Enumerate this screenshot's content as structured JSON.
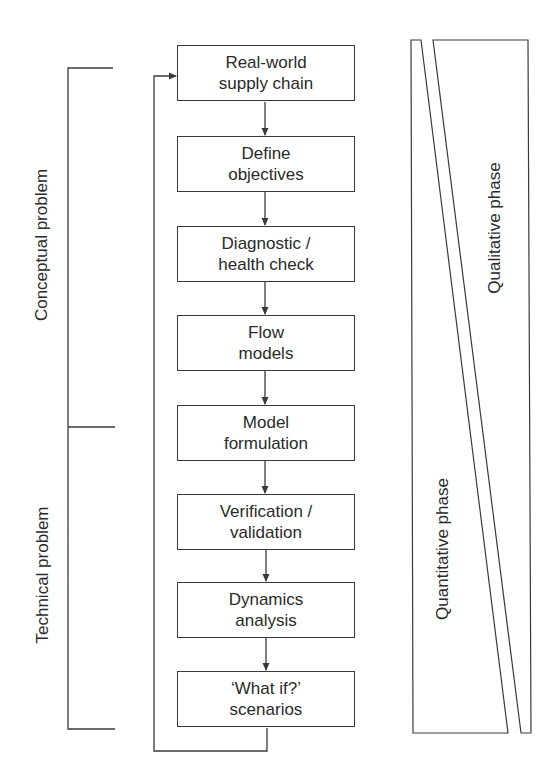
{
  "diagram": {
    "type": "process-flowchart",
    "steps": [
      {
        "line1": "Real-world",
        "line2": "supply chain"
      },
      {
        "line1": "Define",
        "line2": "objectives"
      },
      {
        "line1": "Diagnostic /",
        "line2": "health check"
      },
      {
        "line1": "Flow",
        "line2": "models"
      },
      {
        "line1": "Model",
        "line2": "formulation"
      },
      {
        "line1": "Verification /",
        "line2": "validation"
      },
      {
        "line1": "Dynamics",
        "line2": "analysis"
      },
      {
        "line1": "‘What if?’",
        "line2": "scenarios"
      }
    ],
    "feedback_loop": "from last step back to first step",
    "brackets": {
      "conceptual": "Conceptual problem",
      "technical": "Technical problem"
    },
    "phases": {
      "qualitative": "Qualitative phase",
      "quantitative": "Quantitative phase"
    },
    "colors": {
      "line": "#3a3a3a",
      "text": "#2a2a2a",
      "background": "#ffffff"
    }
  }
}
